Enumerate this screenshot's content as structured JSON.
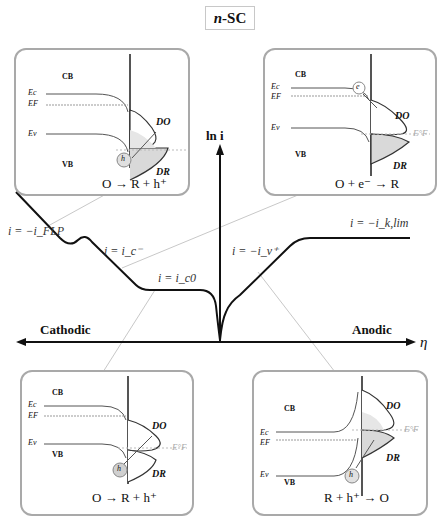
{
  "title": {
    "prefix": "n",
    "suffix": "-SC"
  },
  "axes": {
    "y_label": "ln i",
    "x_label": "η",
    "left_label": "Cathodic",
    "right_label": "Anodic"
  },
  "curve_labels": {
    "flp": "i = −i_FLP",
    "c_minus": "i = i_c⁻",
    "c0": "i = i_c0",
    "v_plus": "i = −i_v⁺",
    "klim": "i = −i_k,lim"
  },
  "panels": {
    "top_left": {
      "cb": "CB",
      "vb": "VB",
      "ec": "Ec",
      "ef": "EF",
      "ev": "Ev",
      "do": "DO",
      "dr": "DR",
      "carrier": "h",
      "reaction": "O → R + h⁺"
    },
    "top_right": {
      "cb": "CB",
      "vb": "VB",
      "ec": "Ec",
      "ef": "EF",
      "ev": "Ev",
      "do": "DO",
      "dr": "DR",
      "redox": "E°F",
      "carrier": "e",
      "reaction": "O + e⁻ → R"
    },
    "bottom_left": {
      "cb": "CB",
      "vb": "VB",
      "ec": "Ec",
      "ef": "EF",
      "ev": "Ev",
      "do": "DO",
      "dr": "DR",
      "redox": "E°F",
      "carrier": "h",
      "reaction": "O → R + h⁺"
    },
    "bottom_right": {
      "cb": "CB",
      "vb": "VB",
      "ec": "Ec",
      "ef": "EF",
      "ev": "Ev",
      "do": "DO",
      "dr": "DR",
      "redox": "E°F",
      "carrier": "h",
      "reaction": "R + h⁺ → O"
    }
  },
  "colors": {
    "axis": "#111111",
    "panel_border": "#a9a9a9",
    "connector": "#c8c8c8",
    "fill": "#d9d9d9"
  }
}
